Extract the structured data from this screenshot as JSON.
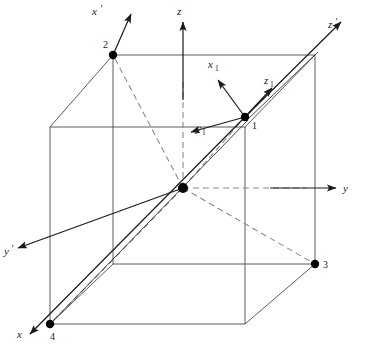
{
  "figure": {
    "background_color": "#ffffff",
    "line_color": "#4a4a4a",
    "arrow_color": "#1a1a1a",
    "dash_color": "#8a8a8a",
    "dot_color": "#000000"
  },
  "axes": {
    "principal": [
      {
        "id": "z",
        "label": "z",
        "prime": ""
      },
      {
        "id": "y",
        "label": "y",
        "prime": ""
      },
      {
        "id": "x",
        "label": "x",
        "prime": ""
      }
    ],
    "primed": [
      {
        "id": "x-prime",
        "label": "x",
        "prime": "′"
      },
      {
        "id": "z-prime",
        "label": "z",
        "prime": "′"
      },
      {
        "id": "y-prime",
        "label": "y",
        "prime": "′"
      }
    ],
    "local": [
      {
        "id": "x1",
        "label": "x",
        "subscript": "1"
      },
      {
        "id": "y1",
        "label": "y",
        "subscript": "1"
      },
      {
        "id": "z1",
        "label": "z",
        "subscript": "1"
      }
    ]
  },
  "vertices": [
    {
      "id": "vertex-1",
      "label": "1",
      "x": 245,
      "y": 117
    },
    {
      "id": "vertex-2",
      "label": "2",
      "x": 113,
      "y": 55
    },
    {
      "id": "vertex-3",
      "label": "3",
      "x": 315,
      "y": 264
    },
    {
      "id": "vertex-4",
      "label": "4",
      "x": 50,
      "y": 324
    }
  ],
  "origin": {
    "id": "origin",
    "label": "",
    "x": 183,
    "y": 188
  }
}
